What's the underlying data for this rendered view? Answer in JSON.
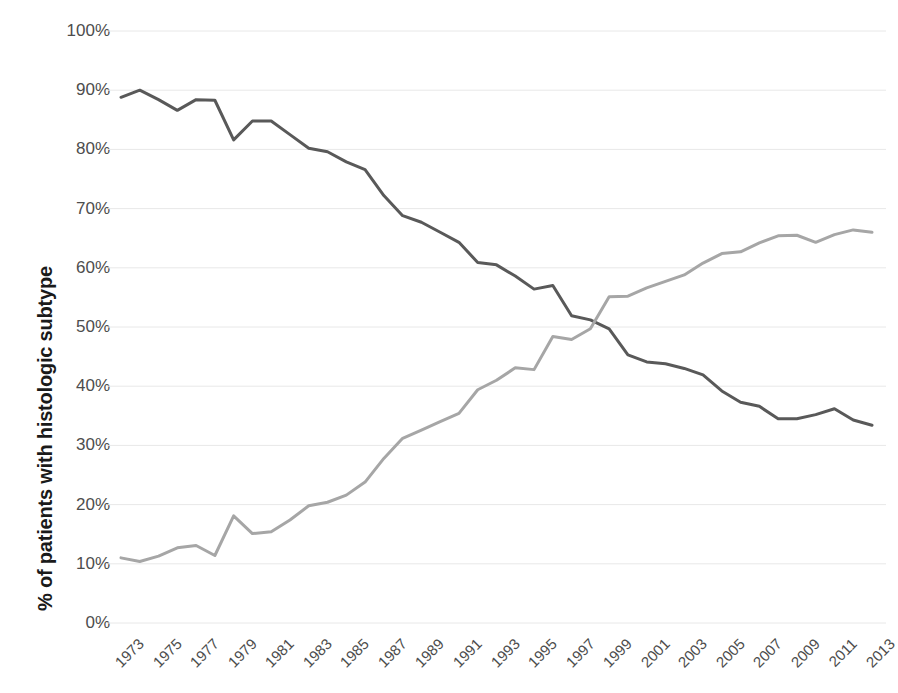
{
  "chart_data": {
    "type": "line",
    "title": "",
    "subtitle": "",
    "xlabel": "",
    "ylabel": "% of patients with histologic subtype",
    "xlim": [
      1973,
      2013
    ],
    "ylim": [
      0,
      100
    ],
    "grid": true,
    "legend": "none",
    "y_tick_labels": [
      "100%",
      "90%",
      "80%",
      "70%",
      "60%",
      "50%",
      "40%",
      "30%",
      "20%",
      "10%",
      "0%"
    ],
    "y_tick_values": [
      100,
      90,
      80,
      70,
      60,
      50,
      40,
      30,
      20,
      10,
      0
    ],
    "x_tick_labels": [
      "1973",
      "1975",
      "1977",
      "1979",
      "1981",
      "1983",
      "1985",
      "1987",
      "1989",
      "1991",
      "1993",
      "1995",
      "1997",
      "1999",
      "2001",
      "2003",
      "2005",
      "2007",
      "2009",
      "2011",
      "2013"
    ],
    "x_tick_values": [
      1973,
      1975,
      1977,
      1979,
      1981,
      1983,
      1985,
      1987,
      1989,
      1991,
      1993,
      1995,
      1997,
      1999,
      2001,
      2003,
      2005,
      2007,
      2009,
      2011,
      2013
    ],
    "x": [
      1973,
      1974,
      1975,
      1976,
      1977,
      1978,
      1979,
      1980,
      1981,
      1982,
      1983,
      1984,
      1985,
      1986,
      1987,
      1988,
      1989,
      1990,
      1991,
      1992,
      1993,
      1994,
      1995,
      1996,
      1997,
      1998,
      1999,
      2000,
      2001,
      2002,
      2003,
      2004,
      2005,
      2006,
      2007,
      2008,
      2009,
      2010,
      2011,
      2012,
      2013
    ],
    "series": [
      {
        "name": "declining-subtype",
        "color": "#595959",
        "values": [
          88.8,
          90.0,
          88.4,
          86.6,
          88.4,
          88.3,
          81.6,
          84.8,
          84.8,
          82.5,
          80.2,
          79.6,
          77.9,
          76.6,
          72.2,
          68.8,
          67.7,
          66.0,
          64.3,
          60.9,
          60.5,
          58.6,
          56.4,
          57.0,
          51.9,
          51.2,
          49.7,
          45.3,
          44.1,
          43.8,
          43.0,
          41.9,
          39.2,
          37.3,
          36.6,
          34.5,
          34.5,
          35.2,
          36.2,
          34.3,
          33.4
        ]
      },
      {
        "name": "rising-subtype",
        "color": "#a6a6a6",
        "values": [
          11.0,
          10.4,
          11.3,
          12.7,
          13.1,
          11.4,
          18.1,
          15.1,
          15.4,
          17.4,
          19.8,
          20.4,
          21.6,
          23.8,
          27.8,
          31.2,
          32.6,
          34.0,
          35.4,
          39.4,
          41.0,
          43.1,
          42.8,
          48.4,
          47.9,
          49.7,
          55.1,
          55.2,
          56.6,
          57.7,
          58.8,
          60.8,
          62.4,
          62.7,
          64.2,
          65.4,
          65.5,
          64.3,
          65.6,
          66.4,
          66.0
        ]
      }
    ]
  },
  "axes": {
    "y_title": "% of patients with histologic subtype"
  }
}
